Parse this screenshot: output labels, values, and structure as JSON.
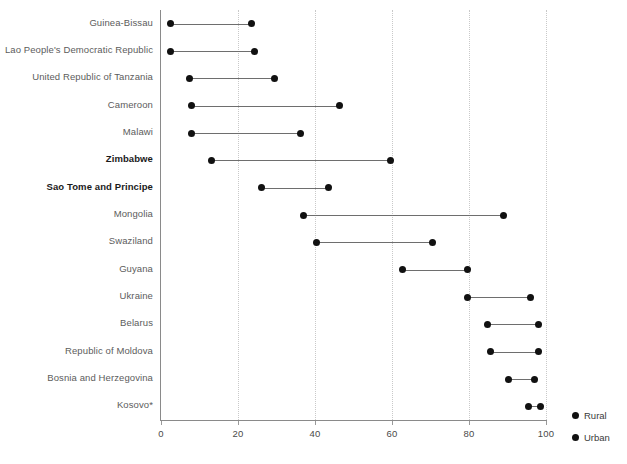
{
  "chart_data": {
    "type": "scatter",
    "subtype": "dumbbell",
    "title": "",
    "subtitle": "",
    "xlabel": "",
    "ylabel": "",
    "xlim": [
      0,
      100
    ],
    "ylim": null,
    "grid": "vertical-dotted",
    "legend_position": "bottom-right",
    "xticks": [
      0,
      20,
      40,
      60,
      80,
      100
    ],
    "xtick_labels": [
      "0",
      "20",
      "40",
      "60",
      "80",
      "100"
    ],
    "categories": [
      "Guinea-Bissau",
      "Lao People's Democratic Republic",
      "United Republic of Tanzania",
      "Cameroon",
      "Malawi",
      "Zimbabwe",
      "Sao Tome and Principe",
      "Mongolia",
      "Swaziland",
      "Guyana",
      "Ukraine",
      "Belarus",
      "Republic of Moldova",
      "Bosnia and Herzegovina",
      "Kosovo*"
    ],
    "emphasized_categories": [
      "Zimbabwe",
      "Sao Tome and Principe"
    ],
    "series": [
      {
        "name": "Rural",
        "color": "#111111",
        "values": [
          2.5,
          2.5,
          7.3,
          8.0,
          8.0,
          13.2,
          26.2,
          37.0,
          40.3,
          62.6,
          79.7,
          84.7,
          85.7,
          90.3,
          95.4
        ]
      },
      {
        "name": "Urban",
        "color": "#111111",
        "values": [
          23.6,
          24.4,
          29.4,
          46.3,
          36.2,
          59.6,
          43.5,
          89.0,
          70.4,
          79.5,
          96.0,
          98.0,
          98.0,
          97.0,
          98.7
        ]
      }
    ]
  },
  "legend": {
    "items": [
      {
        "label": "Rural"
      },
      {
        "label": "Urban"
      }
    ]
  },
  "axis": {
    "x_tick_labels": [
      "0",
      "20",
      "40",
      "60",
      "80",
      "100"
    ]
  }
}
